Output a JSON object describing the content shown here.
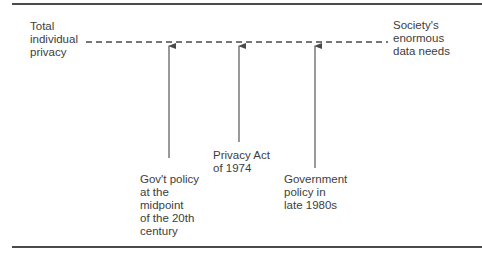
{
  "diagram": {
    "left_end_label": [
      "Total",
      "individual",
      "privacy"
    ],
    "right_end_label": [
      "Society's",
      "enormous",
      "data needs"
    ],
    "markers": [
      {
        "label": [
          "Gov't policy",
          "at the",
          "midpoint",
          "of the 20th",
          "century"
        ]
      },
      {
        "label": [
          "Privacy Act",
          "of 1974"
        ]
      },
      {
        "label": [
          "Government",
          "policy in",
          "late 1980s"
        ]
      }
    ]
  }
}
